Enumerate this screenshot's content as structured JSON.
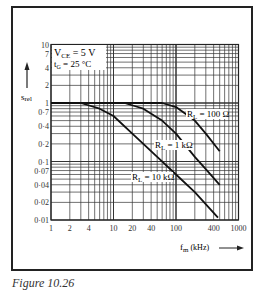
{
  "chart_data": {
    "type": "line",
    "title": "",
    "xlabel": "f_m (kHz)",
    "ylabel": "s_rel",
    "xscale": "log",
    "yscale": "log",
    "xlim": [
      1,
      1000
    ],
    "ylim": [
      0.01,
      10
    ],
    "grid": true,
    "x_ticks": [
      "1",
      "2",
      "4",
      "10",
      "20",
      "40",
      "100",
      "400",
      "1000"
    ],
    "y_ticks": [
      "10",
      "7",
      "4",
      "2",
      "1",
      "0·7",
      "0·4",
      "0·2",
      "0·1",
      "0·07",
      "0·04",
      "0·02",
      "0·01"
    ],
    "annotations": [
      "V_CE = 5 V",
      "t_G = 25 °C"
    ],
    "series": [
      {
        "name": "R_L = 100 Ω",
        "label": "R_L = 100 Ω",
        "x": [
          1,
          60,
          100,
          200,
          300,
          500
        ],
        "y": [
          1,
          1,
          0.85,
          0.5,
          0.3,
          0.15
        ]
      },
      {
        "name": "R_L = 1 kΩ",
        "label": "R_L = 1 kΩ",
        "x": [
          1,
          15,
          30,
          60,
          100,
          200,
          500
        ],
        "y": [
          1,
          1,
          0.8,
          0.5,
          0.3,
          0.12,
          0.04
        ]
      },
      {
        "name": "R_L = 10 kΩ",
        "label": "R_L = 10 kΩ",
        "x": [
          1,
          3,
          6,
          10,
          20,
          50,
          100,
          200,
          470
        ],
        "y": [
          1,
          1,
          0.8,
          0.6,
          0.3,
          0.12,
          0.06,
          0.03,
          0.011
        ]
      }
    ]
  },
  "annotations": {
    "vce": "V",
    "vce_sub": "CE",
    "vce_val": " = 5 V",
    "tg": "t",
    "tg_sub": "G",
    "tg_val": " = 25 °C",
    "ylabel": "s",
    "ylabel_sub": "rel",
    "xlabel": "f",
    "xlabel_sub": "m",
    "xlabel_unit": " (kHz)",
    "label_100": "R",
    "label_100_sub": "L",
    "label_100_val": " = 100 Ω",
    "label_1k_val": " = 1 kΩ",
    "label_10k_val": " = 10 kΩ"
  },
  "caption": "Figure 10.26"
}
